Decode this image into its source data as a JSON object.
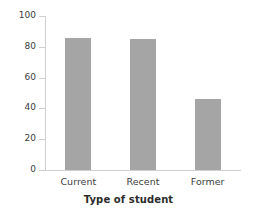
{
  "chart_data": {
    "type": "bar",
    "title": "",
    "xlabel": "Type of student",
    "ylabel": "",
    "categories": [
      "Current",
      "Recent",
      "Former"
    ],
    "values": [
      86,
      85,
      46
    ],
    "ylim": [
      0,
      100
    ],
    "yticks": [
      0,
      20,
      40,
      60,
      80,
      100
    ],
    "ytick_labels": [
      "0",
      "20",
      "40",
      "60",
      "80",
      "100"
    ],
    "grid": false,
    "legend": null,
    "bar_color": "#a5a5a5",
    "axis_color": "#cfcfcf",
    "text_color": "#3d3d3d",
    "background": "#ffffff"
  }
}
